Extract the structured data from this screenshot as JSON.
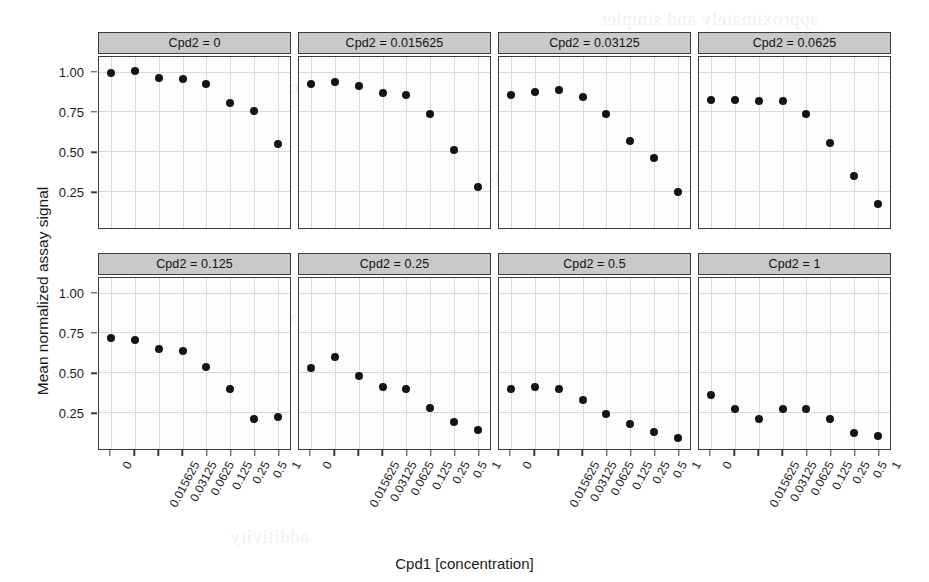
{
  "chart_data": {
    "type": "scatter",
    "title": "",
    "xlabel": "Cpd1 [concentration]",
    "ylabel": "Mean normalized assay signal",
    "grid": true,
    "legend": "none",
    "layout": "trellis 4 columns x 2 rows",
    "x_categories": [
      "0",
      "0.015625",
      "0.03125",
      "0.0625",
      "0.125",
      "0.25",
      "0.5",
      "1"
    ],
    "y_ticks": [
      "0.25",
      "0.50",
      "0.75",
      "1.00"
    ],
    "y_tick_values": [
      0.25,
      0.5,
      0.75,
      1.0
    ],
    "ylim": [
      0.02,
      1.1
    ],
    "panel_variable": "Cpd2",
    "panels": [
      {
        "strip": "Cpd2 = 0",
        "cond_value": "0",
        "values": [
          1.0,
          1.01,
          0.97,
          0.96,
          0.93,
          0.81,
          0.76,
          0.55
        ]
      },
      {
        "strip": "Cpd2 = 0.015625",
        "cond_value": "0.015625",
        "values": [
          0.93,
          0.94,
          0.92,
          0.87,
          0.86,
          0.74,
          0.51,
          0.28
        ]
      },
      {
        "strip": "Cpd2 = 0.03125",
        "cond_value": "0.03125",
        "values": [
          0.86,
          0.88,
          0.89,
          0.85,
          0.74,
          0.57,
          0.46,
          0.25
        ]
      },
      {
        "strip": "Cpd2 = 0.0625",
        "cond_value": "0.0625",
        "values": [
          0.83,
          0.83,
          0.82,
          0.82,
          0.74,
          0.56,
          0.35,
          0.17
        ]
      },
      {
        "strip": "Cpd2 = 0.125",
        "cond_value": "0.125",
        "values": [
          0.72,
          0.71,
          0.65,
          0.64,
          0.54,
          0.4,
          0.21,
          0.22
        ]
      },
      {
        "strip": "Cpd2 = 0.25",
        "cond_value": "0.25",
        "values": [
          0.53,
          0.6,
          0.48,
          0.41,
          0.4,
          0.28,
          0.19,
          0.14
        ]
      },
      {
        "strip": "Cpd2 = 0.5",
        "cond_value": "0.5",
        "values": [
          0.4,
          0.41,
          0.4,
          0.33,
          0.24,
          0.18,
          0.13,
          0.09
        ]
      },
      {
        "strip": "Cpd2 = 1",
        "cond_value": "1",
        "values": [
          0.36,
          0.27,
          0.21,
          0.27,
          0.27,
          0.21,
          0.12,
          0.1
        ]
      }
    ]
  },
  "bleed_text": [
    "approximately and simpler",
    "concentration  response",
    "experimental  design",
    "the  matrix  of  combinations",
    "additivity"
  ]
}
